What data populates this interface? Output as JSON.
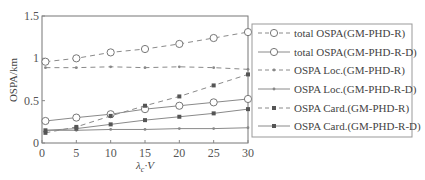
{
  "chart_data": {
    "type": "line",
    "title": "",
    "xlabel": "λc·V",
    "ylabel": "OSPA/km",
    "xlim": [
      0,
      30
    ],
    "ylim": [
      0,
      1.5
    ],
    "xticks": [
      "0",
      "5",
      "10",
      "15",
      "20",
      "25",
      "30"
    ],
    "yticks": [
      "0",
      "0.5",
      "1",
      "1.5"
    ],
    "grid": false,
    "legend_position": "right-outside",
    "x": [
      0.5,
      5,
      10,
      15,
      20,
      25,
      30
    ],
    "series": [
      {
        "name": "total OSPA(GM-PHD-R)",
        "style": "dashed",
        "marker": "open-circle",
        "values": [
          0.96,
          1.0,
          1.07,
          1.11,
          1.17,
          1.24,
          1.31
        ]
      },
      {
        "name": "total OSPA(GM-PHD-R-D)",
        "style": "solid",
        "marker": "open-circle",
        "values": [
          0.26,
          0.3,
          0.34,
          0.4,
          0.44,
          0.48,
          0.52
        ]
      },
      {
        "name": "OSPA Loc.(GM-PHD-R)",
        "style": "dashed",
        "marker": "small-dot",
        "values": [
          0.89,
          0.89,
          0.9,
          0.89,
          0.9,
          0.89,
          0.87
        ]
      },
      {
        "name": "OSPA Loc.(GM-PHD-R-D)",
        "style": "solid",
        "marker": "small-dot",
        "values": [
          0.15,
          0.15,
          0.16,
          0.16,
          0.17,
          0.17,
          0.18
        ]
      },
      {
        "name": "OSPA Card.(GM-PHD-R)",
        "style": "dashed",
        "marker": "filled-dot",
        "values": [
          0.12,
          0.19,
          0.32,
          0.44,
          0.55,
          0.68,
          0.81
        ]
      },
      {
        "name": "OSPA Card.(GM-PHD-R-D)",
        "style": "solid",
        "marker": "filled-dot",
        "values": [
          0.15,
          0.17,
          0.22,
          0.27,
          0.31,
          0.35,
          0.4
        ]
      }
    ]
  }
}
